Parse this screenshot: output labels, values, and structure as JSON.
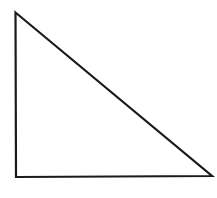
{
  "diagram": {
    "shape": "right-triangle",
    "stroke_color": "#1a1a1a",
    "fill_color": "#ffffff",
    "stroke_width": 2.2,
    "vertices": {
      "top": [
        15.5,
        12.5
      ],
      "bottom_left": [
        16,
        177
      ],
      "bottom_right": [
        212,
        176
      ]
    }
  }
}
